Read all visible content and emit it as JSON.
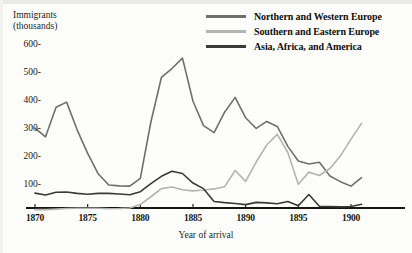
{
  "chart_data": {
    "type": "line",
    "title": "",
    "ylabel": "Immigrants\n(thousands)",
    "xlabel": "Year of arrival",
    "xlim": [
      1869,
      1903
    ],
    "ylim": [
      0,
      640
    ],
    "grid": false,
    "legend_position": "top-right",
    "x_ticks": [
      "1870",
      "1875",
      "1880",
      "1885",
      "1890",
      "1895",
      "1900"
    ],
    "x_tick_values": [
      1870,
      1875,
      1880,
      1885,
      1890,
      1895,
      1900
    ],
    "y_ticks": [
      "100-",
      "200-",
      "300-",
      "400-",
      "500-",
      "600-"
    ],
    "y_tick_values": [
      100,
      200,
      300,
      400,
      500,
      600
    ],
    "x": [
      1870,
      1871,
      1872,
      1873,
      1874,
      1875,
      1876,
      1877,
      1878,
      1879,
      1880,
      1881,
      1882,
      1883,
      1884,
      1885,
      1886,
      1887,
      1888,
      1889,
      1890,
      1891,
      1892,
      1893,
      1894,
      1895,
      1896,
      1897,
      1898,
      1899,
      1900,
      1901
    ],
    "series": [
      {
        "name": "Northern and Western Europe",
        "color": "#6f6f6d",
        "values": [
          303,
          272,
          378,
          396,
          297,
          213,
          140,
          100,
          97,
          96,
          124,
          325,
          484,
          516,
          553,
          399,
          312,
          287,
          360,
          413,
          340,
          302,
          327,
          309,
          238,
          186,
          175,
          181,
          132,
          112,
          96,
          126
        ]
      },
      {
        "name": "Southern and Eastern Europe",
        "color": "#b4b4b2",
        "values": [
          12,
          12,
          14,
          16,
          17,
          17,
          17,
          15,
          16,
          18,
          30,
          58,
          87,
          93,
          83,
          79,
          82,
          86,
          94,
          152,
          113,
          182,
          243,
          281,
          216,
          103,
          146,
          134,
          159,
          204,
          264,
          320
        ]
      },
      {
        "name": "Asia, Africa, and America",
        "color": "#3a3a38",
        "values": [
          71,
          64,
          74,
          75,
          70,
          67,
          70,
          70,
          68,
          65,
          76,
          105,
          131,
          149,
          141,
          107,
          87,
          41,
          37,
          34,
          30,
          38,
          36,
          33,
          41,
          26,
          66,
          24,
          23,
          22,
          23,
          31
        ]
      }
    ]
  },
  "legend": {
    "items": [
      {
        "label": "Northern and Western Europe",
        "color": "#6f6f6d"
      },
      {
        "label": "Southern and Eastern Europe",
        "color": "#b4b4b2"
      },
      {
        "label": "Asia, Africa, and America",
        "color": "#3a3a38"
      }
    ]
  },
  "axis": {
    "y_title": "Immigrants\n(thousands)",
    "x_title": "Year of arrival"
  }
}
